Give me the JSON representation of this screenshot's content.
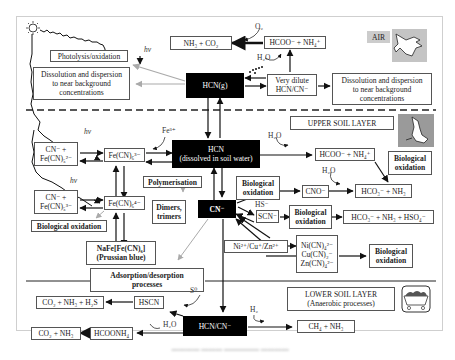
{
  "layers": {
    "air": "AIR",
    "upper_soil": "UPPER SOIL LAYER",
    "lower_soil": "LOWER SOIL LAYER\n(Anaerobic processes)"
  },
  "air": {
    "photolysis": "Photolysis/oxidation",
    "dissolution_left": "Dissolution and dispersion\nto near background\nconcentrations",
    "hcn_g": "HCN(g)",
    "nh3_co2": "NH₃ + CO₂",
    "hcoo_nh4": "HCOO⁻ + NH₄⁺",
    "o2": "O₂",
    "h2o": "H₂O",
    "very_dilute": "Very dilute\nHCN/CN⁻",
    "dissolution_right": "Dissolution and dispersion\nto near background\nconcentrations",
    "hv": "hν"
  },
  "upper": {
    "hv1": "hν",
    "hv2": "hν",
    "fe3": "Fe³⁺",
    "cn_fe5_2": "CN⁻ +\nFe(CN)₅²⁻",
    "fe6_3": "Fe(CN)₆³⁻",
    "hcn_dissolved": "HCN\n(dissolved in soil water)",
    "h2o_1": "H₂O",
    "hcoo_nh4": "HCOO⁻ + NH₄⁺",
    "bio_ox_1": "Biological\noxidation",
    "polymerisation": "Polymerisation",
    "dimers": "Dimers,\ntrimers",
    "cn_fe5_3": "CN⁻ +\nFe(CN)₅³⁻",
    "fe6_4": "Fe(CN)₆⁴⁻",
    "bio_ox_left": "Biological oxidation",
    "prussian": "NaFe[Fe(CN)₆]\n(Prussian blue)",
    "cn": "CN⁻",
    "bio_ox_2": "Biological\noxidation",
    "cno": "CNO⁻",
    "h2o_2": "H₂O",
    "hco3_nh3": "HCO₃⁻ + NH₃",
    "hs": "HS⁻",
    "scn": "SCN⁻",
    "bio_ox_3": "Biological\noxidation",
    "hco3_nh3_hso4": "HCO₃⁻ + NH₃ + HSO₄⁻",
    "metals": "Ni²⁺/Cu⁺/Zn²⁺",
    "complexes": "Ni(CN)₄²⁻\nCu(CN)₂⁻\nZn(CN)₄²⁻",
    "bio_ox_4": "Biological\noxidation",
    "adsorption": "Adsorption/desorption\nprocesses"
  },
  "lower": {
    "co2_nh3_h2s": "CO₂ + NH₃ + H₂S",
    "hscn": "HSCN",
    "s0": "S⁰",
    "h2o": "H₂O",
    "co2_nh3": "CO₂ + NH₃",
    "hcoonh4": "HCOONH₄",
    "hcn_cn": "HCN/CN⁻",
    "h2": "H₂",
    "ch4_nh3": "CH₄ + NH₃"
  },
  "icons": [
    "sun-icon",
    "bird-icon",
    "rabbit-icon",
    "mine-cart-icon"
  ]
}
